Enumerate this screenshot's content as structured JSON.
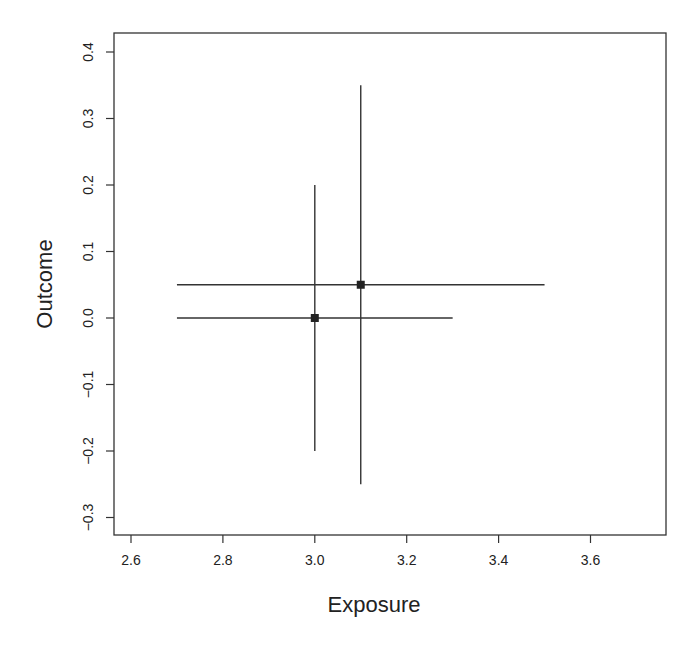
{
  "chart_data": {
    "type": "scatter",
    "title": "",
    "xlabel": "Exposure",
    "ylabel": "Outcome",
    "xlim": [
      2.56,
      3.65
    ],
    "ylim": [
      -0.325,
      0.43
    ],
    "x_ticks": [
      2.6,
      2.8,
      3.0,
      3.2,
      3.4,
      3.6
    ],
    "x_tick_labels": [
      "2.6",
      "2.8",
      "3.0",
      "3.2",
      "3.4",
      "3.6"
    ],
    "y_ticks": [
      0.4,
      0.3,
      0.2,
      0.1,
      0.0,
      -0.1,
      -0.2,
      -0.3
    ],
    "y_tick_labels": [
      "0.4",
      "0.3",
      "0.2",
      "0.1",
      "0.0",
      "−0.1",
      "−0.2",
      "−0.3"
    ],
    "grid": false,
    "legend": null,
    "points": [
      {
        "x": 3.0,
        "y": 0.0,
        "x_low": 2.7,
        "x_high": 3.3,
        "y_low": -0.2,
        "y_high": 0.2
      },
      {
        "x": 3.1,
        "y": 0.05,
        "x_low": 2.7,
        "x_high": 3.5,
        "y_low": -0.25,
        "y_high": 0.35
      }
    ],
    "marker": "filled-square",
    "color": "#222222"
  }
}
